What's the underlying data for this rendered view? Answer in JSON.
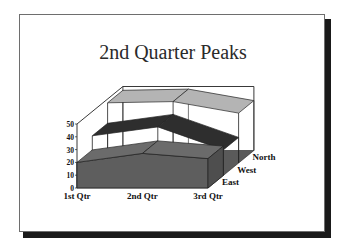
{
  "slide": {
    "title": "2nd Quarter Peaks"
  },
  "chart_data": {
    "type": "area",
    "subtype": "3d-area",
    "title": "2nd Quarter Peaks",
    "categories": [
      "1st Qtr",
      "2nd Qtr",
      "3rd Qtr"
    ],
    "series": [
      {
        "name": "East",
        "values": [
          20,
          27,
          23
        ],
        "color": "#6b6b6b"
      },
      {
        "name": "West",
        "values": [
          31,
          38,
          20
        ],
        "color": "#2e2e2e"
      },
      {
        "name": "North",
        "values": [
          47,
          48,
          39
        ],
        "color": "#b4b4b4"
      }
    ],
    "xlabel": "",
    "ylabel": "",
    "ylim": [
      0,
      50
    ],
    "yticks": [
      "0",
      "10",
      "20",
      "30",
      "40",
      "50"
    ],
    "grid": false,
    "legend": "none (series labels on depth axis)",
    "floor_color": "#5a5a5a"
  }
}
